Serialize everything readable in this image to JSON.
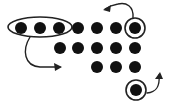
{
  "diagram": {
    "colors": {
      "dot": "#111111",
      "stroke": "#222222",
      "background": "#ffffff"
    },
    "dot_radius": 6,
    "rows": [
      {
        "y": 28,
        "xs": [
          21,
          40,
          59,
          78,
          97,
          116,
          135
        ]
      },
      {
        "y": 48,
        "xs": [
          60,
          78,
          97,
          116,
          135
        ]
      },
      {
        "y": 67,
        "xs": [
          97,
          116,
          135
        ]
      }
    ],
    "extra_dots": [
      {
        "x": 136,
        "y": 90
      }
    ],
    "group_ellipse": {
      "cx": 40,
      "cy": 27,
      "rx": 32,
      "ry": 10
    },
    "circled": [
      {
        "cx": 135,
        "cy": 28,
        "r": 10
      },
      {
        "cx": 136,
        "cy": 90,
        "r": 10
      }
    ],
    "arrows": [
      {
        "name": "group-move-arrow",
        "path": "M30 37 C 22 50, 24 66, 40 67 L 60 67",
        "head": "62,67 54,63 55,71"
      },
      {
        "name": "top-circle-arrow",
        "path": "M133 18 C 134 6, 126 2, 118 4 C 112 5, 108 7, 105 9",
        "head": "103,10 111,5 110,12"
      },
      {
        "name": "bottom-circle-arrow",
        "path": "M147 93 C 157 92, 160 86, 159 75",
        "head": "160,72 155,79 163,79"
      }
    ]
  }
}
